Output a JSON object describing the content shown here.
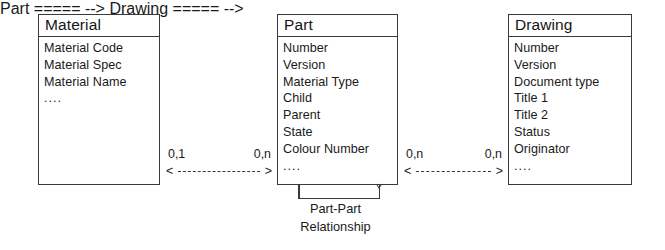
{
  "diagram": {
    "type": "entity-relationship-diagram",
    "background_color": "#ffffff",
    "line_color": "#3a3a3a",
    "text_color": "#1a1a1a"
  },
  "entities": [
    {
      "id": "material",
      "title": "Material",
      "attributes": [
        "Material Code",
        "Material Spec",
        "Material Name",
        "...."
      ]
    },
    {
      "id": "part",
      "title": "Part",
      "attributes": [
        "Number",
        "Version",
        "Material Type",
        "Child",
        "Parent",
        "State",
        "Colour Number",
        "...."
      ]
    },
    {
      "id": "drawing",
      "title": "Drawing",
      "attributes": [
        "Number",
        "Version",
        "Document type",
        "Title 1",
        "Title 2",
        "Status",
        "Originator",
        "...."
      ]
    }
  ],
  "relationships": [
    {
      "id": "material-part",
      "from": "material",
      "to": "part",
      "left_cardinality": "0,1",
      "right_cardinality": "0,n",
      "left_arrow": "<",
      "right_arrow": ">",
      "line_style": "dashed"
    },
    {
      "id": "part-drawing",
      "from": "part",
      "to": "drawing",
      "left_cardinality": "0,n",
      "right_cardinality": "0,n",
      "left_arrow": "<",
      "right_arrow": ">",
      "line_style": "dashed"
    }
  ],
  "self_relationship": {
    "id": "part-part",
    "entity": "part",
    "caption_line_1": "Part-Part",
    "caption_line_2": "Relationship"
  }
}
